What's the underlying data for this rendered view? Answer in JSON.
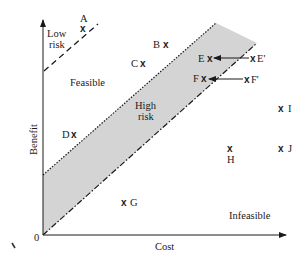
{
  "diagram": {
    "axes": {
      "x_label": "Cost",
      "y_label": "Benefit",
      "origin_label": "0"
    },
    "regions": {
      "low_risk": [
        "Low",
        "risk"
      ],
      "feasible": "Feasible",
      "high_risk": [
        "High",
        "risk"
      ],
      "infeasible": "Infeasible"
    },
    "points": [
      {
        "id": "A",
        "label": "A"
      },
      {
        "id": "B",
        "label": "B"
      },
      {
        "id": "C",
        "label": "C"
      },
      {
        "id": "D",
        "label": "D"
      },
      {
        "id": "E",
        "label": "E"
      },
      {
        "id": "E_prime",
        "label": "E'"
      },
      {
        "id": "F",
        "label": "F"
      },
      {
        "id": "F_prime",
        "label": "F'"
      },
      {
        "id": "G",
        "label": "G"
      },
      {
        "id": "H",
        "label": "H"
      },
      {
        "id": "I",
        "label": "I"
      },
      {
        "id": "J",
        "label": "J"
      }
    ],
    "marker_glyph": "x",
    "arrows": [
      {
        "from": "E'",
        "to": "E"
      },
      {
        "from": "F'",
        "to": "F"
      }
    ],
    "colors": {
      "band_fill": "#d4d4d4",
      "ink": "#1a1a1a",
      "background": "#ffffff"
    }
  }
}
